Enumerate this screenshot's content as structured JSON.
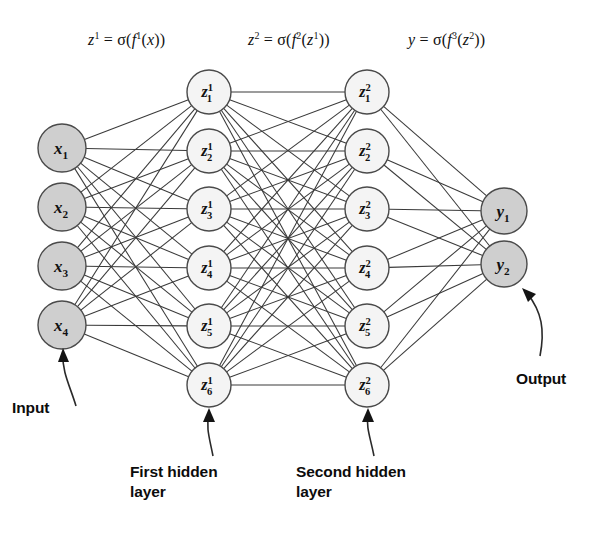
{
  "diagram": {
    "canvas": {
      "width": 610,
      "height": 541
    },
    "colors": {
      "node_filled": "#cfcfcf",
      "node_open": "#f4f4f4",
      "node_stroke": "#4a4a4a",
      "edge": "#3a3a3a",
      "text": "#111111",
      "background": "#ffffff"
    },
    "formulas": [
      {
        "id": "formula-layer1",
        "base": "z",
        "sup": "1",
        "rhs": "= σ( f",
        "rhs_sup": "1",
        "rhs_tail": "(x))",
        "text": "z¹ = σ(f¹(x))",
        "x": 88,
        "y": 30
      },
      {
        "id": "formula-layer2",
        "base": "z",
        "sup": "2",
        "rhs": "= σ( f",
        "rhs_sup": "2",
        "rhs_tail": "(z¹))",
        "text": "z² = σ(f²(z¹))",
        "x": 248,
        "y": 30
      },
      {
        "id": "formula-output",
        "base": "y",
        "sup": "",
        "rhs": "= σ( f",
        "rhs_sup": "3",
        "rhs_tail": "(z²))",
        "text": "y = σ(f³(z²))",
        "x": 408,
        "y": 30
      }
    ],
    "layers": [
      {
        "id": "input-layer",
        "name": "input",
        "style": "filled",
        "cx": 62,
        "radius": 24,
        "nodes": [
          {
            "id": "node-x1",
            "base": "x",
            "sub": "1",
            "sup": "",
            "label": "x₁",
            "cy": 148
          },
          {
            "id": "node-x2",
            "base": "x",
            "sub": "2",
            "sup": "",
            "label": "x₂",
            "cy": 207
          },
          {
            "id": "node-x3",
            "base": "x",
            "sub": "3",
            "sup": "",
            "label": "x₃",
            "cy": 266
          },
          {
            "id": "node-x4",
            "base": "x",
            "sub": "4",
            "sup": "",
            "label": "x₄",
            "cy": 325
          }
        ]
      },
      {
        "id": "hidden-layer-1",
        "name": "first hidden layer",
        "style": "open",
        "cx": 209,
        "radius": 22,
        "nodes": [
          {
            "id": "node-z1-1",
            "base": "z",
            "sub": "1",
            "sup": "1",
            "label": "z¹₁",
            "cy": 92
          },
          {
            "id": "node-z1-2",
            "base": "z",
            "sub": "2",
            "sup": "1",
            "label": "z¹₂",
            "cy": 151
          },
          {
            "id": "node-z1-3",
            "base": "z",
            "sub": "3",
            "sup": "1",
            "label": "z¹₃",
            "cy": 209
          },
          {
            "id": "node-z1-4",
            "base": "z",
            "sub": "4",
            "sup": "1",
            "label": "z¹₄",
            "cy": 268
          },
          {
            "id": "node-z1-5",
            "base": "z",
            "sub": "5",
            "sup": "1",
            "label": "z¹₅",
            "cy": 326
          },
          {
            "id": "node-z1-6",
            "base": "z",
            "sub": "6",
            "sup": "1",
            "label": "z¹₆",
            "cy": 385
          }
        ]
      },
      {
        "id": "hidden-layer-2",
        "name": "second hidden layer",
        "style": "open",
        "cx": 367,
        "radius": 22,
        "nodes": [
          {
            "id": "node-z2-1",
            "base": "z",
            "sub": "1",
            "sup": "2",
            "label": "z²₁",
            "cy": 92
          },
          {
            "id": "node-z2-2",
            "base": "z",
            "sub": "2",
            "sup": "2",
            "label": "z²₂",
            "cy": 151
          },
          {
            "id": "node-z2-3",
            "base": "z",
            "sub": "3",
            "sup": "2",
            "label": "z²₃",
            "cy": 209
          },
          {
            "id": "node-z2-4",
            "base": "z",
            "sub": "4",
            "sup": "2",
            "label": "z²₄",
            "cy": 268
          },
          {
            "id": "node-z2-5",
            "base": "z",
            "sub": "5",
            "sup": "2",
            "label": "z²₅",
            "cy": 326
          },
          {
            "id": "node-z2-6",
            "base": "z",
            "sub": "6",
            "sup": "2",
            "label": "z²₆",
            "cy": 385
          }
        ]
      },
      {
        "id": "output-layer",
        "name": "output",
        "style": "filled",
        "cx": 504,
        "radius": 23,
        "nodes": [
          {
            "id": "node-y1",
            "base": "y",
            "sub": "1",
            "sup": "",
            "label": "y₁",
            "cy": 211
          },
          {
            "id": "node-y2",
            "base": "y",
            "sub": "2",
            "sup": "",
            "label": "y₂",
            "cy": 264
          }
        ]
      }
    ],
    "annotations": [
      {
        "id": "annotation-input",
        "text": "Input",
        "x": 12,
        "y": 398,
        "pointer": {
          "d": "M 76 406 C 70 386 62 372 63 354",
          "head": "M 63 348 L 58 362 L 69 362 Z"
        }
      },
      {
        "id": "annotation-first-hidden",
        "text": "First hidden\nlayer",
        "x": 130,
        "y": 462,
        "pointer": {
          "d": "M 213 456 C 209 436 206 428 209 414",
          "head": "M 209 408 L 203 422 L 215 422 Z"
        }
      },
      {
        "id": "annotation-second-hidden",
        "text": "Second hidden\nlayer",
        "x": 296,
        "y": 462,
        "pointer": {
          "d": "M 374 456 C 370 436 366 428 368 414",
          "head": "M 368 408 L 362 422 L 374 422 Z"
        }
      },
      {
        "id": "annotation-output",
        "text": "Output",
        "x": 516,
        "y": 369,
        "pointer": {
          "d": "M 540 356 C 545 330 542 312 527 293",
          "head": "M 522 288 L 528 302 L 536 294 Z"
        }
      }
    ]
  }
}
